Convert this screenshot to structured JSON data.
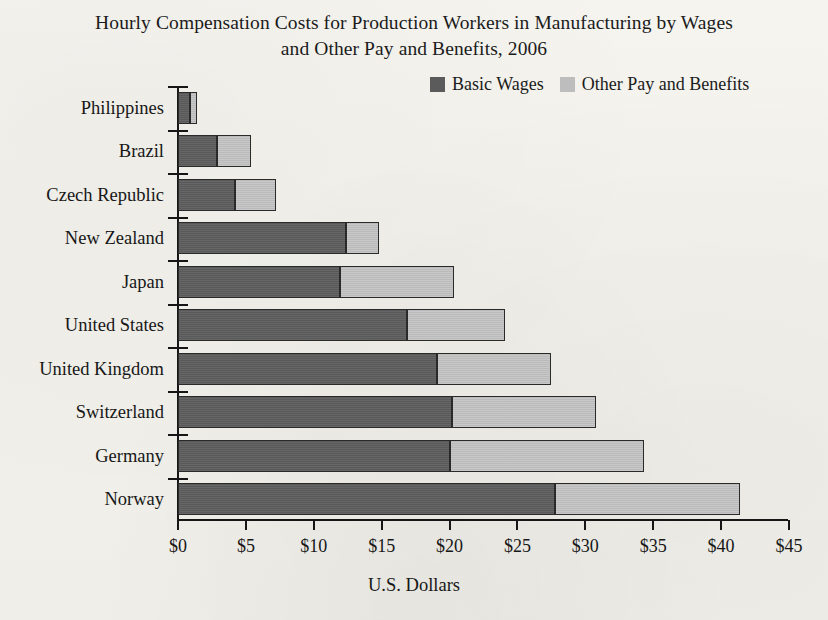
{
  "chart_data": {
    "type": "bar",
    "orientation": "horizontal",
    "stacked": true,
    "title": "Hourly Compensation Costs for Production Workers in Manufacturing by Wages and Other Pay and Benefits, 2006",
    "title_line1": "Hourly Compensation Costs for Production Workers in Manufacturing by Wages",
    "title_line2": "and Other Pay and Benefits, 2006",
    "xlabel": "U.S. Dollars",
    "ylabel": "",
    "xlim": [
      0,
      45
    ],
    "xtick_labels": [
      "$0",
      "$5",
      "$10",
      "$15",
      "$20",
      "$25",
      "$30",
      "$35",
      "$40",
      "$45"
    ],
    "xtick_values": [
      0,
      5,
      10,
      15,
      20,
      25,
      30,
      35,
      40,
      45
    ],
    "grid": false,
    "legend_position": "top-right",
    "categories": [
      "Philippines",
      "Brazil",
      "Czech Republic",
      "New Zealand",
      "Japan",
      "United States",
      "United Kingdom",
      "Switzerland",
      "Germany",
      "Norway"
    ],
    "series": [
      {
        "name": "Basic Wages",
        "color": "#5e5e5e",
        "values": [
          0.9,
          2.9,
          4.2,
          12.4,
          11.9,
          16.9,
          19.1,
          20.2,
          20.0,
          27.8
        ]
      },
      {
        "name": "Other Pay and Benefits",
        "color": "#c2c2c2",
        "values": [
          0.5,
          2.5,
          3.0,
          2.4,
          8.4,
          7.2,
          8.4,
          10.6,
          14.3,
          13.6
        ]
      }
    ],
    "totals": [
      1.4,
      5.4,
      7.2,
      14.8,
      20.3,
      24.1,
      27.5,
      30.8,
      34.3,
      41.4
    ]
  },
  "legend": {
    "entries": [
      {
        "label": "Basic Wages",
        "color": "#5e5e5e"
      },
      {
        "label": "Other Pay and Benefits",
        "color": "#bdbdbd"
      }
    ]
  }
}
